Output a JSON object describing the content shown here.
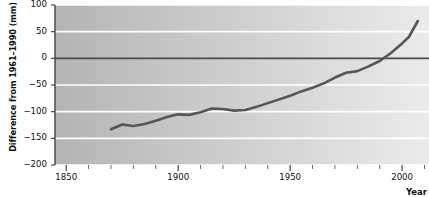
{
  "chart_data": {
    "type": "line",
    "title": "",
    "xlabel": "Year",
    "ylabel": "Difference from 1961–1990 (mm)",
    "xlim": [
      1845,
      2012
    ],
    "ylim": [
      -200,
      100
    ],
    "grid": true,
    "legend": null,
    "series_name": "Global mean sea level",
    "line_color": "#565656",
    "zero_line_color": "#4a4a4a",
    "gridline_color": "#ffffff",
    "plot_bg_left": "#b4b4b4",
    "plot_bg_right": "#ebebeb",
    "y_ticks": [
      100,
      50,
      0,
      -50,
      -100,
      -150,
      -200
    ],
    "y_tick_labels": [
      "100",
      "50",
      "0",
      "−50",
      "−100",
      "−150",
      "−200"
    ],
    "x_ticks": [
      1850,
      1900,
      1950,
      2000
    ],
    "x_tick_labels": [
      "1850",
      "1900",
      "1950",
      "2000"
    ],
    "x_minor_ticks": [
      1860,
      1870,
      1880,
      1890,
      1910,
      1920,
      1930,
      1940,
      1960,
      1970,
      1980,
      1990,
      2010
    ],
    "x": [
      1870,
      1875,
      1880,
      1885,
      1890,
      1895,
      1900,
      1905,
      1910,
      1915,
      1920,
      1925,
      1930,
      1935,
      1940,
      1945,
      1950,
      1955,
      1960,
      1965,
      1970,
      1975,
      1980,
      1985,
      1990,
      1995,
      2000,
      2003,
      2007
    ],
    "values": [
      -133,
      -124,
      -127,
      -123,
      -117,
      -110,
      -105,
      -106,
      -101,
      -94,
      -95,
      -98,
      -97,
      -91,
      -84,
      -77,
      -70,
      -62,
      -55,
      -47,
      -36,
      -27,
      -24,
      -15,
      -5,
      10,
      28,
      40,
      70
    ]
  },
  "axis": {
    "y_label_text": "Difference from 1961–1990 (mm)",
    "x_label_text": "Year"
  }
}
